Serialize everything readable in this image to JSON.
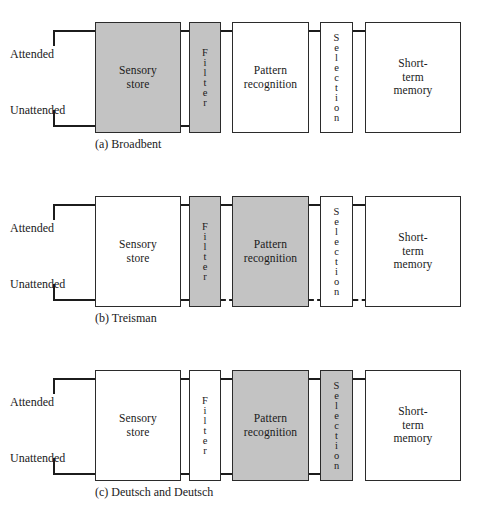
{
  "figure": {
    "input_labels": {
      "attended": "Attended",
      "unattended": "Unattended"
    },
    "stage_labels": {
      "sensory_store": "Sensory\nstore",
      "filter": "Filter",
      "pattern_recognition": "Pattern\nrecognition",
      "selection": "Selection",
      "short_term_memory": "Short-\nterm\nmemory"
    },
    "colors": {
      "shaded_fill": "#c3c3c3",
      "box_fill": "#ffffff",
      "stroke": "#1c1c1c",
      "background": "#ffffff"
    },
    "panels": [
      {
        "id": "a",
        "caption": "(a) Broadbent",
        "shaded_stages": [
          "sensory_store",
          "filter"
        ],
        "unattended_flow_ends_at": "filter",
        "dashed_segments": []
      },
      {
        "id": "b",
        "caption": "(b) Treisman",
        "shaded_stages": [
          "filter",
          "pattern_recognition"
        ],
        "unattended_flow_ends_at": "short_term_memory",
        "dashed_segments": [
          "filter-to-pattern_recognition",
          "pattern_recognition-to-selection",
          "selection-to-short_term_memory"
        ]
      },
      {
        "id": "c",
        "caption": "(c) Deutsch and Deutsch",
        "shaded_stages": [
          "pattern_recognition",
          "selection"
        ],
        "unattended_flow_ends_at": "selection",
        "dashed_segments": []
      }
    ]
  }
}
